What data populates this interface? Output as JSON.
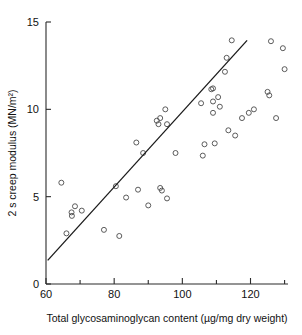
{
  "chart_data": {
    "type": "scatter",
    "title": "",
    "xlabel": "Total glycosaminoglycan content (µg/mg dry weight)",
    "ylabel": "2 s creep modulus (MN/m²)",
    "xlim": [
      60,
      131
    ],
    "ylim": [
      0,
      15
    ],
    "grid": false,
    "legend": "none",
    "x_ticks_major": [
      60,
      80,
      100,
      120
    ],
    "x_ticks_major_labels": [
      "60",
      "80",
      "100",
      "120"
    ],
    "x_ticks_minor": [
      70,
      90,
      110,
      130
    ],
    "y_ticks_major": [
      0,
      5,
      10,
      15
    ],
    "y_ticks_major_labels": [
      "0",
      "5",
      "10",
      "15"
    ],
    "marker_style": "open-circle",
    "points": [
      {
        "x": 64.5,
        "y": 5.8
      },
      {
        "x": 66.0,
        "y": 2.9
      },
      {
        "x": 67.5,
        "y": 4.1
      },
      {
        "x": 67.6,
        "y": 3.9
      },
      {
        "x": 68.5,
        "y": 4.45
      },
      {
        "x": 70.5,
        "y": 4.2
      },
      {
        "x": 77.0,
        "y": 3.1
      },
      {
        "x": 80.5,
        "y": 5.6
      },
      {
        "x": 81.5,
        "y": 2.75
      },
      {
        "x": 83.5,
        "y": 4.95
      },
      {
        "x": 86.5,
        "y": 8.1
      },
      {
        "x": 87.0,
        "y": 5.4
      },
      {
        "x": 88.5,
        "y": 7.5
      },
      {
        "x": 90.0,
        "y": 4.5
      },
      {
        "x": 92.5,
        "y": 9.35
      },
      {
        "x": 93.0,
        "y": 9.15
      },
      {
        "x": 93.5,
        "y": 9.5
      },
      {
        "x": 93.5,
        "y": 5.5
      },
      {
        "x": 94.0,
        "y": 5.35
      },
      {
        "x": 95.0,
        "y": 10.0
      },
      {
        "x": 95.5,
        "y": 9.15
      },
      {
        "x": 95.5,
        "y": 4.9
      },
      {
        "x": 98.0,
        "y": 7.5
      },
      {
        "x": 105.5,
        "y": 10.35
      },
      {
        "x": 106.0,
        "y": 7.35
      },
      {
        "x": 106.5,
        "y": 8.0
      },
      {
        "x": 108.5,
        "y": 11.15
      },
      {
        "x": 109.0,
        "y": 11.2
      },
      {
        "x": 109.0,
        "y": 10.45
      },
      {
        "x": 109.0,
        "y": 9.8
      },
      {
        "x": 109.5,
        "y": 8.05
      },
      {
        "x": 110.5,
        "y": 10.7
      },
      {
        "x": 111.0,
        "y": 10.15
      },
      {
        "x": 112.5,
        "y": 12.15
      },
      {
        "x": 113.0,
        "y": 12.95
      },
      {
        "x": 113.5,
        "y": 8.8
      },
      {
        "x": 114.5,
        "y": 13.95
      },
      {
        "x": 115.5,
        "y": 8.5
      },
      {
        "x": 117.5,
        "y": 9.5
      },
      {
        "x": 119.5,
        "y": 9.8
      },
      {
        "x": 121.0,
        "y": 10.0
      },
      {
        "x": 125.0,
        "y": 11.0
      },
      {
        "x": 125.5,
        "y": 10.8
      },
      {
        "x": 126.0,
        "y": 13.9
      },
      {
        "x": 127.5,
        "y": 9.5
      },
      {
        "x": 129.5,
        "y": 13.5
      },
      {
        "x": 130.0,
        "y": 12.3
      }
    ],
    "fit_line": {
      "type": "linear-regression",
      "x_start": 60.5,
      "y_start": 1.35,
      "x_end": 119.0,
      "y_end": 13.95
    }
  }
}
